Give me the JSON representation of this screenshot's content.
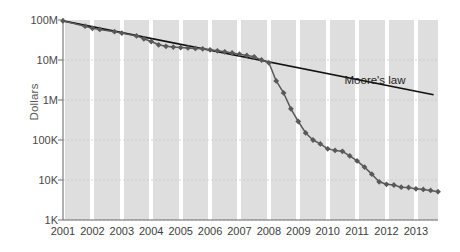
{
  "chart_data": {
    "type": "line",
    "title": "",
    "xlabel": "",
    "ylabel": "Dollars",
    "yscale": "log",
    "ylim": [
      1000,
      100000000
    ],
    "xlim": [
      2001,
      2013.75
    ],
    "grid": true,
    "legend_position": "inline-annotation",
    "y_tick_labels": [
      "100M",
      "10M",
      "1M",
      "100K",
      "10K",
      "1K"
    ],
    "y_tick_values": [
      100000000,
      10000000,
      1000000,
      100000,
      10000,
      1000
    ],
    "x_tick_labels": [
      "2001",
      "2002",
      "2003",
      "2004",
      "2005",
      "2006",
      "2007",
      "2008",
      "2009",
      "2010",
      "2011",
      "2012",
      "2013"
    ],
    "x_tick_values": [
      2001,
      2002,
      2003,
      2004,
      2005,
      2006,
      2007,
      2008,
      2009,
      2010,
      2011,
      2012,
      2013
    ],
    "annotations": [
      {
        "text": "Moore's law",
        "x": 2012.0,
        "y": 3000000
      }
    ],
    "series": [
      {
        "name": "Cost per genome",
        "marker": "diamond",
        "color": "#595959",
        "points": [
          {
            "x": 2001.0,
            "y": 95000000
          },
          {
            "x": 2001.75,
            "y": 70000000
          },
          {
            "x": 2002.0,
            "y": 62000000
          },
          {
            "x": 2002.25,
            "y": 58000000
          },
          {
            "x": 2002.75,
            "y": 51000000
          },
          {
            "x": 2003.0,
            "y": 47000000
          },
          {
            "x": 2003.5,
            "y": 40000000
          },
          {
            "x": 2003.75,
            "y": 34000000
          },
          {
            "x": 2004.0,
            "y": 29000000
          },
          {
            "x": 2004.25,
            "y": 24000000
          },
          {
            "x": 2004.5,
            "y": 22000000
          },
          {
            "x": 2004.75,
            "y": 21000000
          },
          {
            "x": 2005.0,
            "y": 20500000
          },
          {
            "x": 2005.25,
            "y": 20000000
          },
          {
            "x": 2005.5,
            "y": 19500000
          },
          {
            "x": 2005.75,
            "y": 19000000
          },
          {
            "x": 2006.0,
            "y": 18000000
          },
          {
            "x": 2006.25,
            "y": 17000000
          },
          {
            "x": 2006.5,
            "y": 16000000
          },
          {
            "x": 2006.75,
            "y": 15000000
          },
          {
            "x": 2007.0,
            "y": 14000000
          },
          {
            "x": 2007.25,
            "y": 13000000
          },
          {
            "x": 2007.5,
            "y": 12000000
          },
          {
            "x": 2007.75,
            "y": 10000000
          },
          {
            "x": 2008.0,
            "y": 8500000
          },
          {
            "x": 2008.25,
            "y": 3000000
          },
          {
            "x": 2008.5,
            "y": 1500000
          },
          {
            "x": 2008.75,
            "y": 600000
          },
          {
            "x": 2009.0,
            "y": 290000
          },
          {
            "x": 2009.25,
            "y": 150000
          },
          {
            "x": 2009.5,
            "y": 100000
          },
          {
            "x": 2009.75,
            "y": 80000
          },
          {
            "x": 2010.0,
            "y": 60000
          },
          {
            "x": 2010.25,
            "y": 55000
          },
          {
            "x": 2010.5,
            "y": 52000
          },
          {
            "x": 2010.75,
            "y": 40000
          },
          {
            "x": 2011.0,
            "y": 30000
          },
          {
            "x": 2011.25,
            "y": 21000
          },
          {
            "x": 2011.5,
            "y": 14000
          },
          {
            "x": 2011.75,
            "y": 9000
          },
          {
            "x": 2012.0,
            "y": 7800
          },
          {
            "x": 2012.25,
            "y": 7500
          },
          {
            "x": 2012.5,
            "y": 6600
          },
          {
            "x": 2012.75,
            "y": 6500
          },
          {
            "x": 2013.0,
            "y": 6000
          },
          {
            "x": 2013.25,
            "y": 5800
          },
          {
            "x": 2013.5,
            "y": 5500
          },
          {
            "x": 2013.75,
            "y": 5100
          }
        ]
      },
      {
        "name": "Moore's law",
        "marker": "none",
        "color": "#111111",
        "points": [
          {
            "x": 2001.0,
            "y": 95000000
          },
          {
            "x": 2013.6,
            "y": 1350000
          }
        ]
      }
    ]
  },
  "style": {
    "band_color": "#dedede",
    "grid_color": "#c9c9c9",
    "axis_color": "#6f6f6f",
    "tick_text_color": "#3d3d3d",
    "ylabel_color": "#5a5a5a",
    "annotation_color": "#1e1e1e"
  }
}
